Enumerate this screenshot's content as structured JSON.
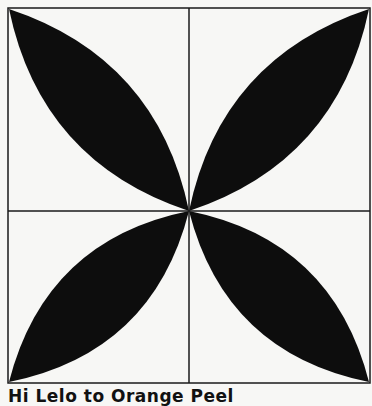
{
  "figure": {
    "caption": "Hi Lelo to Orange Peel",
    "colors": {
      "background": "#f7f7f5",
      "petal": "#0d0d0d",
      "line": "#1a1a1a"
    },
    "grid": {
      "rows": 2,
      "cols": 2
    },
    "petals": [
      {
        "name": "top-left",
        "from": "outer corner",
        "to": "center"
      },
      {
        "name": "top-right",
        "from": "outer corner",
        "to": "center"
      },
      {
        "name": "bottom-left",
        "from": "outer corner",
        "to": "center"
      },
      {
        "name": "bottom-right",
        "from": "outer corner",
        "to": "center"
      }
    ]
  }
}
